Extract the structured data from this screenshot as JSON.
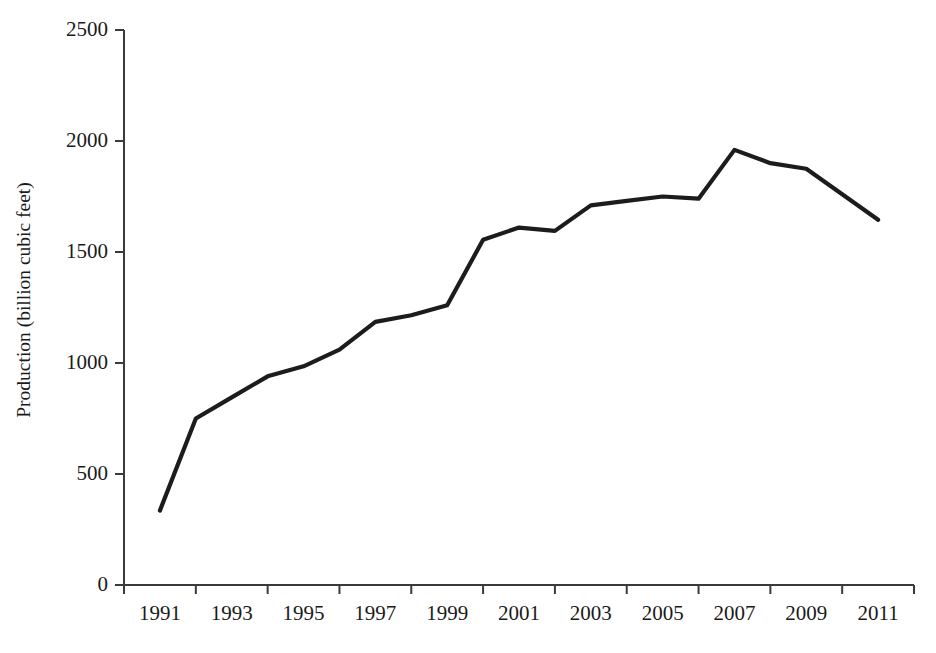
{
  "chart_data": {
    "type": "line",
    "title": "",
    "xlabel": "",
    "ylabel": "Production (billion cubic feet)",
    "x": [
      1991,
      1992,
      1993,
      1994,
      1995,
      1996,
      1997,
      1998,
      1999,
      2000,
      2001,
      2002,
      2003,
      2004,
      2005,
      2006,
      2007,
      2008,
      2009,
      2010,
      2011
    ],
    "values": [
      335,
      750,
      845,
      940,
      985,
      1060,
      1185,
      1215,
      1260,
      1555,
      1610,
      1595,
      1710,
      1730,
      1750,
      1740,
      1960,
      1900,
      1875,
      1760,
      1645
    ],
    "series": [
      {
        "name": "Production",
        "values": [
          335,
          750,
          845,
          940,
          985,
          1060,
          1185,
          1215,
          1260,
          1555,
          1610,
          1595,
          1710,
          1730,
          1750,
          1740,
          1960,
          1900,
          1875,
          1760,
          1645
        ]
      }
    ],
    "xlim": [
      1990,
      2012
    ],
    "ylim": [
      0,
      2500
    ],
    "ytick_values": [
      0,
      500,
      1000,
      1500,
      2000,
      2500
    ],
    "ytick_labels": [
      "0",
      "500",
      "1000",
      "1500",
      "2000",
      "2500"
    ],
    "xtick_values": [
      1990,
      1992,
      1994,
      1996,
      1998,
      2000,
      2002,
      2004,
      2006,
      2008,
      2010,
      2012
    ],
    "xtick_labels": [
      "1991",
      "1993",
      "1995",
      "1997",
      "1999",
      "2001",
      "2003",
      "2005",
      "2007",
      "2009",
      "2011"
    ],
    "grid": false,
    "legend": "none",
    "line_color": "#1c1c1c",
    "axis_color": "#3a3a3a",
    "background": "#ffffff"
  },
  "axes": {
    "y_axis_title": "Production (billion cubic feet)"
  }
}
